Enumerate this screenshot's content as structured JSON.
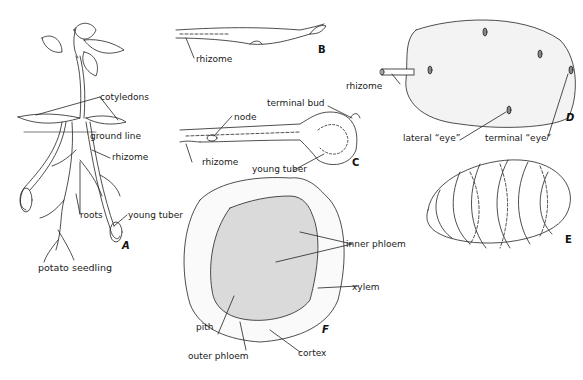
{
  "figure": {
    "panels": [
      {
        "id": "A",
        "caption": "potato seedling",
        "labels": [
          "cotyledons",
          "ground line",
          "rhizome",
          "roots",
          "young tuber"
        ]
      },
      {
        "id": "B",
        "labels": [
          "rhizome"
        ]
      },
      {
        "id": "C",
        "labels": [
          "terminal bud",
          "node",
          "rhizome",
          "young tuber"
        ]
      },
      {
        "id": "D",
        "labels": [
          "rhizome",
          "lateral “eye”",
          "terminal “eye”"
        ]
      },
      {
        "id": "E",
        "labels": []
      },
      {
        "id": "F",
        "labels": [
          "inner phloem",
          "xylem",
          "pith",
          "outer phloem",
          "cortex"
        ]
      }
    ]
  }
}
